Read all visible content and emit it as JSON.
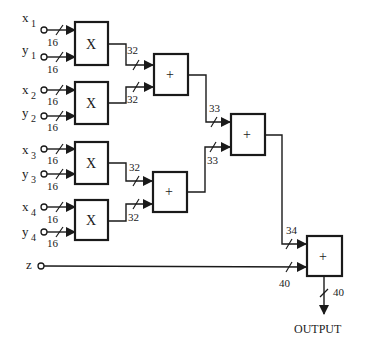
{
  "diagram": {
    "type": "adder-tree datapath",
    "inputs": [
      {
        "name": "x",
        "sub": "1",
        "width": "16"
      },
      {
        "name": "y",
        "sub": "1",
        "width": "16"
      },
      {
        "name": "x",
        "sub": "2",
        "width": "16"
      },
      {
        "name": "y",
        "sub": "2",
        "width": "16"
      },
      {
        "name": "x",
        "sub": "3",
        "width": "16"
      },
      {
        "name": "y",
        "sub": "3",
        "width": "16"
      },
      {
        "name": "x",
        "sub": "4",
        "width": "16"
      },
      {
        "name": "y",
        "sub": "4",
        "width": "16"
      },
      {
        "name": "z",
        "sub": "",
        "width": "40"
      }
    ],
    "multipliers": [
      {
        "label": "X",
        "out_width": "32"
      },
      {
        "label": "X",
        "out_width": "32"
      },
      {
        "label": "X",
        "out_width": "32"
      },
      {
        "label": "X",
        "out_width": "32"
      }
    ],
    "adders_level1": [
      {
        "label": "+",
        "out_width": "33"
      },
      {
        "label": "+",
        "out_width": "33"
      }
    ],
    "adder_level2": {
      "label": "+",
      "out_width": "34"
    },
    "final_adder": {
      "label": "+",
      "out_width": "40"
    },
    "output_label": "OUTPUT"
  }
}
